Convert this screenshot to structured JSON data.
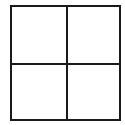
{
  "diagram": {
    "type": "2x2 grid",
    "rows": 2,
    "columns": 2,
    "line_color": "#1a1a1a",
    "background": "#ffffff",
    "cells": [
      {
        "position": "top-left",
        "text": ""
      },
      {
        "position": "top-right",
        "text": ""
      },
      {
        "position": "bottom-left",
        "text": ""
      },
      {
        "position": "bottom-right",
        "text": ""
      }
    ]
  }
}
